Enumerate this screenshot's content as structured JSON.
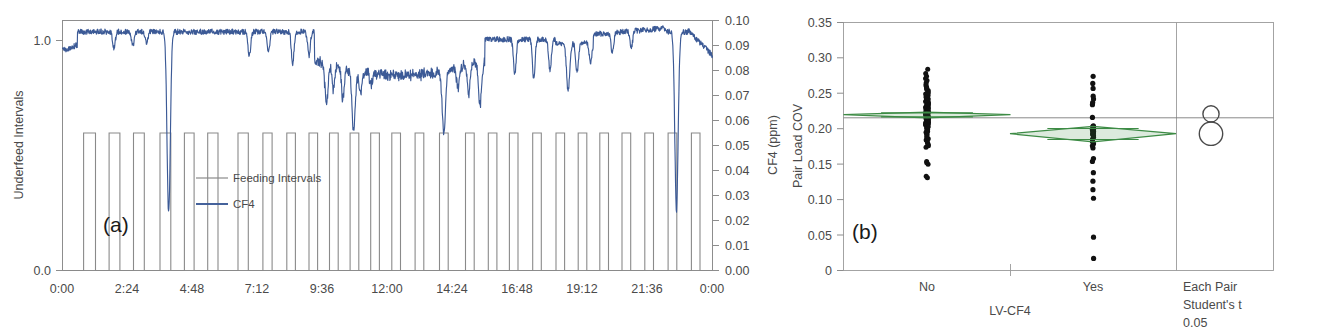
{
  "figure": {
    "panels": [
      "(a)",
      "(b)"
    ]
  },
  "chart_data": [
    {
      "type": "line",
      "panel_tag": "(a)",
      "title": "",
      "xlabel": "",
      "ylabel": "Underfeed Intervals",
      "y2label": "CF4 (ppm)",
      "x_tick_labels": [
        "0:00",
        "2:24",
        "4:48",
        "7:12",
        "9:36",
        "12:00",
        "14:24",
        "16:48",
        "19:12",
        "21:36",
        "0:00"
      ],
      "x_tick_hours": [
        0,
        2.4,
        4.8,
        7.2,
        9.6,
        12.0,
        14.4,
        16.8,
        19.2,
        21.6,
        24.0
      ],
      "xlim": [
        0,
        24
      ],
      "y_tick_labels": [
        "0.0",
        "1.0"
      ],
      "ylim": [
        0,
        1.0
      ],
      "y2_tick_labels": [
        "0.00",
        "0.01",
        "0.02",
        "0.03",
        "0.04",
        "0.05",
        "0.06",
        "0.07",
        "0.08",
        "0.09",
        "0.10"
      ],
      "y2lim": [
        0,
        0.1
      ],
      "grid": false,
      "legend_position": "inside-left",
      "legend": [
        {
          "name": "Feeding Intervals",
          "color": "#8a8a8a"
        },
        {
          "name": "CF4",
          "color": "#3c5a96"
        }
      ],
      "series": [
        {
          "name": "Feeding Intervals",
          "axis": "left",
          "kind": "square-wave",
          "high": 1.0,
          "low": 0.45,
          "note": "binary feeding on/off cycles across 24 h; high = feeding",
          "transitions_hours": [
            0.0,
            0.78,
            1.22,
            1.72,
            2.12,
            2.62,
            3.02,
            3.6,
            4.0,
            4.5,
            4.86,
            5.36,
            5.74,
            6.48,
            6.86,
            7.4,
            7.74,
            8.28,
            8.6,
            9.1,
            9.42,
            9.86,
            10.18,
            10.62,
            10.94,
            11.38,
            11.7,
            12.16,
            12.48,
            13.02,
            13.34,
            13.92,
            14.24,
            14.88,
            15.2,
            15.72,
            16.04,
            16.5,
            16.82,
            17.36,
            17.68,
            18.22,
            18.54,
            19.04,
            19.36,
            19.84,
            20.16,
            20.66,
            20.98,
            21.5,
            21.82,
            22.36,
            22.68,
            23.22,
            23.54,
            24.0
          ]
        },
        {
          "name": "CF4",
          "axis": "right",
          "kind": "timeseries",
          "units": "ppm",
          "baseline_ppm": 0.005,
          "max_ppm": 0.078,
          "notable_peaks": [
            {
              "time": "3:55",
              "hours": 3.92,
              "value_ppm": 0.077
            },
            {
              "time": "9:45",
              "hours": 9.75,
              "value_ppm": 0.033
            },
            {
              "time": "10:45",
              "hours": 10.75,
              "value_ppm": 0.044
            },
            {
              "time": "14:05",
              "hours": 14.08,
              "value_ppm": 0.045
            },
            {
              "time": "15:25",
              "hours": 15.42,
              "value_ppm": 0.033
            },
            {
              "time": "18:40",
              "hours": 18.67,
              "value_ppm": 0.028
            },
            {
              "time": "22:40",
              "hours": 22.67,
              "value_ppm": 0.076
            }
          ]
        }
      ]
    },
    {
      "type": "scatter",
      "panel_tag": "(b)",
      "subtype": "oneway-analysis-of-variance",
      "title": "",
      "xlabel": "LV-CF4",
      "ylabel": "Pair Load COV",
      "y_tick_labels": [
        "0",
        "0.05",
        "0.10",
        "0.15",
        "0.20",
        "0.25",
        "0.30",
        "0.35"
      ],
      "y_tick_values": [
        0,
        0.05,
        0.1,
        0.15,
        0.2,
        0.25,
        0.3,
        0.35
      ],
      "ylim": [
        0,
        0.35
      ],
      "grid": false,
      "categories": [
        "No",
        "Yes"
      ],
      "grand_mean": 0.1345,
      "comparison_panel": {
        "label_lines": [
          "Each Pair",
          "Student's t",
          "0.05"
        ],
        "circles": [
          {
            "group": "No",
            "center": 0.129,
            "radius_units": 0.0115
          },
          {
            "group": "Yes",
            "center": 0.157,
            "radius_units": 0.0165
          }
        ]
      },
      "groups": [
        {
          "name": "No",
          "mean": 0.13,
          "ci_low": 0.1265,
          "ci_high": 0.1345,
          "n": 120,
          "min": 0.066,
          "max": 0.219,
          "values": [
            0.219,
            0.217,
            0.2,
            0.198,
            0.196,
            0.176,
            0.174,
            0.172,
            0.17,
            0.168,
            0.166,
            0.164,
            0.162,
            0.16,
            0.158,
            0.156,
            0.155,
            0.154,
            0.153,
            0.152,
            0.151,
            0.15,
            0.149,
            0.148,
            0.147,
            0.146,
            0.145,
            0.1445,
            0.144,
            0.1435,
            0.143,
            0.1425,
            0.142,
            0.1415,
            0.141,
            0.1405,
            0.14,
            0.1395,
            0.139,
            0.1385,
            0.138,
            0.1375,
            0.137,
            0.1365,
            0.136,
            0.1355,
            0.135,
            0.1345,
            0.134,
            0.1335,
            0.133,
            0.1325,
            0.132,
            0.1315,
            0.131,
            0.1305,
            0.13,
            0.1295,
            0.129,
            0.1285,
            0.128,
            0.1275,
            0.127,
            0.1265,
            0.126,
            0.1255,
            0.125,
            0.1245,
            0.124,
            0.1235,
            0.123,
            0.1225,
            0.122,
            0.1215,
            0.121,
            0.1205,
            0.12,
            0.1195,
            0.119,
            0.1185,
            0.118,
            0.1175,
            0.117,
            0.1165,
            0.116,
            0.1155,
            0.115,
            0.1145,
            0.114,
            0.1135,
            0.113,
            0.1125,
            0.112,
            0.1115,
            0.111,
            0.1105,
            0.11,
            0.109,
            0.108,
            0.107,
            0.106,
            0.105,
            0.104,
            0.103,
            0.102,
            0.101,
            0.1,
            0.099,
            0.098,
            0.096,
            0.094,
            0.092,
            0.09,
            0.088,
            0.085,
            0.082,
            0.079,
            0.076,
            0.072,
            0.066
          ]
        },
        {
          "name": "Yes",
          "mean": 0.157,
          "ci_low": 0.1465,
          "ci_high": 0.1685,
          "n": 36,
          "min": 0.076,
          "max": 0.333,
          "values": [
            0.333,
            0.303,
            0.248,
            0.236,
            0.224,
            0.212,
            0.196,
            0.192,
            0.177,
            0.174,
            0.171,
            0.168,
            0.165,
            0.162,
            0.16,
            0.158,
            0.157,
            0.156,
            0.155,
            0.154,
            0.153,
            0.152,
            0.151,
            0.15,
            0.149,
            0.148,
            0.147,
            0.146,
            0.134,
            0.116,
            0.113,
            0.108,
            0.104,
            0.093,
            0.086,
            0.076
          ]
        }
      ]
    }
  ]
}
